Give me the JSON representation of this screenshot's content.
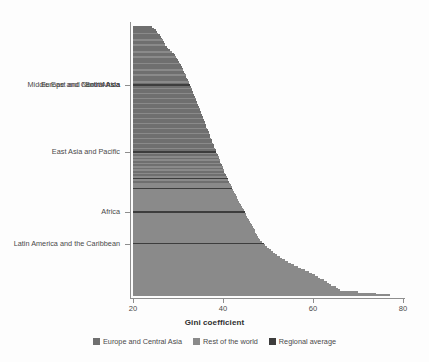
{
  "chart_data": {
    "type": "bar",
    "orientation": "horizontal",
    "title": "",
    "xlabel": "Gini coefficient",
    "ylabel": "",
    "xlim": [
      20,
      80
    ],
    "ylim": [
      0,
      160
    ],
    "grid": false,
    "xticks": [
      20,
      40,
      60,
      80
    ],
    "xtick_labels": [
      "20",
      "40",
      "60",
      "80"
    ],
    "legend_position": "bottom",
    "legend": [
      {
        "label": "Europe and Central Asia",
        "color": "#6f6f6f"
      },
      {
        "label": "Rest of the world",
        "color": "#8a8a8a"
      },
      {
        "label": "Regional average",
        "color": "#3d3d3d"
      }
    ],
    "ytick_labels": [
      {
        "label": "Europe and Central Asia",
        "value": 32.7
      },
      {
        "label": "South Asia",
        "value": 34.7
      },
      {
        "label": "Middle East and North Africa",
        "value": 35.0
      },
      {
        "label": "East Asia and Pacific",
        "value": 36.6
      },
      {
        "label": "Africa",
        "value": 44.8
      },
      {
        "label": "Latin America and the Caribbean",
        "value": 49.0
      }
    ],
    "series": [
      {
        "name": "Europe and Central Asia",
        "color": "#6f6f6f"
      },
      {
        "name": "Rest of the world",
        "color": "#8a8a8a"
      },
      {
        "name": "Regional average",
        "color": "#3d3d3d"
      }
    ],
    "values": [
      {
        "v": 24.2,
        "g": "eca"
      },
      {
        "v": 24.6,
        "g": "eca"
      },
      {
        "v": 25.0,
        "g": "eca"
      },
      {
        "v": 25.3,
        "g": "eca"
      },
      {
        "v": 25.6,
        "g": "rest"
      },
      {
        "v": 25.9,
        "g": "eca"
      },
      {
        "v": 26.2,
        "g": "eca"
      },
      {
        "v": 26.4,
        "g": "eca"
      },
      {
        "v": 26.6,
        "g": "rest"
      },
      {
        "v": 26.8,
        "g": "eca"
      },
      {
        "v": 27.0,
        "g": "eca"
      },
      {
        "v": 27.2,
        "g": "rest"
      },
      {
        "v": 27.5,
        "g": "eca"
      },
      {
        "v": 27.8,
        "g": "eca"
      },
      {
        "v": 28.2,
        "g": "eca"
      },
      {
        "v": 28.6,
        "g": "rest"
      },
      {
        "v": 29.0,
        "g": "eca"
      },
      {
        "v": 29.3,
        "g": "eca"
      },
      {
        "v": 29.5,
        "g": "rest"
      },
      {
        "v": 29.8,
        "g": "eca"
      },
      {
        "v": 30.0,
        "g": "eca"
      },
      {
        "v": 30.2,
        "g": "eca"
      },
      {
        "v": 30.4,
        "g": "rest"
      },
      {
        "v": 30.6,
        "g": "eca"
      },
      {
        "v": 30.8,
        "g": "eca"
      },
      {
        "v": 31.0,
        "g": "eca"
      },
      {
        "v": 31.2,
        "g": "rest"
      },
      {
        "v": 31.4,
        "g": "eca"
      },
      {
        "v": 31.5,
        "g": "eca"
      },
      {
        "v": 31.7,
        "g": "rest"
      },
      {
        "v": 31.8,
        "g": "eca"
      },
      {
        "v": 32.0,
        "g": "eca"
      },
      {
        "v": 32.2,
        "g": "eca"
      },
      {
        "v": 32.4,
        "g": "rest"
      },
      {
        "v": 32.5,
        "g": "eca"
      },
      {
        "v": 32.7,
        "g": "avg"
      },
      {
        "v": 32.8,
        "g": "eca"
      },
      {
        "v": 33.0,
        "g": "rest"
      },
      {
        "v": 33.1,
        "g": "eca"
      },
      {
        "v": 33.3,
        "g": "eca"
      },
      {
        "v": 33.4,
        "g": "rest"
      },
      {
        "v": 33.6,
        "g": "eca"
      },
      {
        "v": 33.7,
        "g": "eca"
      },
      {
        "v": 33.9,
        "g": "rest"
      },
      {
        "v": 34.0,
        "g": "eca"
      },
      {
        "v": 34.2,
        "g": "eca"
      },
      {
        "v": 34.3,
        "g": "rest"
      },
      {
        "v": 34.5,
        "g": "eca"
      },
      {
        "v": 34.6,
        "g": "eca"
      },
      {
        "v": 34.8,
        "g": "rest"
      },
      {
        "v": 34.9,
        "g": "eca"
      },
      {
        "v": 35.0,
        "g": "eca"
      },
      {
        "v": 35.2,
        "g": "rest"
      },
      {
        "v": 35.3,
        "g": "eca"
      },
      {
        "v": 35.5,
        "g": "eca"
      },
      {
        "v": 35.6,
        "g": "rest"
      },
      {
        "v": 35.8,
        "g": "eca"
      },
      {
        "v": 35.9,
        "g": "eca"
      },
      {
        "v": 36.0,
        "g": "rest"
      },
      {
        "v": 36.2,
        "g": "eca"
      },
      {
        "v": 36.3,
        "g": "eca"
      },
      {
        "v": 36.5,
        "g": "rest"
      },
      {
        "v": 36.6,
        "g": "eca"
      },
      {
        "v": 36.8,
        "g": "eca"
      },
      {
        "v": 36.9,
        "g": "rest"
      },
      {
        "v": 37.0,
        "g": "eca"
      },
      {
        "v": 37.2,
        "g": "eca"
      },
      {
        "v": 37.3,
        "g": "rest"
      },
      {
        "v": 37.5,
        "g": "eca"
      },
      {
        "v": 37.6,
        "g": "eca"
      },
      {
        "v": 37.8,
        "g": "rest"
      },
      {
        "v": 37.9,
        "g": "eca"
      },
      {
        "v": 38.1,
        "g": "eca"
      },
      {
        "v": 38.2,
        "g": "rest"
      },
      {
        "v": 38.4,
        "g": "eca"
      },
      {
        "v": 38.5,
        "g": "avg"
      },
      {
        "v": 38.7,
        "g": "rest"
      },
      {
        "v": 38.8,
        "g": "eca"
      },
      {
        "v": 39.0,
        "g": "rest"
      },
      {
        "v": 39.1,
        "g": "eca"
      },
      {
        "v": 39.3,
        "g": "rest"
      },
      {
        "v": 39.4,
        "g": "eca"
      },
      {
        "v": 39.6,
        "g": "rest"
      },
      {
        "v": 39.7,
        "g": "eca"
      },
      {
        "v": 39.9,
        "g": "rest"
      },
      {
        "v": 40.0,
        "g": "eca"
      },
      {
        "v": 40.2,
        "g": "rest"
      },
      {
        "v": 40.3,
        "g": "eca"
      },
      {
        "v": 40.5,
        "g": "rest"
      },
      {
        "v": 40.6,
        "g": "eca"
      },
      {
        "v": 40.8,
        "g": "rest"
      },
      {
        "v": 41.0,
        "g": "avg"
      },
      {
        "v": 41.2,
        "g": "rest"
      },
      {
        "v": 41.3,
        "g": "eca"
      },
      {
        "v": 41.5,
        "g": "rest"
      },
      {
        "v": 41.7,
        "g": "rest"
      },
      {
        "v": 41.9,
        "g": "rest"
      },
      {
        "v": 42.0,
        "g": "avg"
      },
      {
        "v": 42.2,
        "g": "rest"
      },
      {
        "v": 42.4,
        "g": "rest"
      },
      {
        "v": 42.6,
        "g": "rest"
      },
      {
        "v": 42.8,
        "g": "rest"
      },
      {
        "v": 43.0,
        "g": "rest"
      },
      {
        "v": 43.2,
        "g": "rest"
      },
      {
        "v": 43.4,
        "g": "rest"
      },
      {
        "v": 43.6,
        "g": "rest"
      },
      {
        "v": 43.8,
        "g": "rest"
      },
      {
        "v": 44.0,
        "g": "rest"
      },
      {
        "v": 44.2,
        "g": "rest"
      },
      {
        "v": 44.4,
        "g": "rest"
      },
      {
        "v": 44.6,
        "g": "rest"
      },
      {
        "v": 44.8,
        "g": "avg"
      },
      {
        "v": 45.0,
        "g": "rest"
      },
      {
        "v": 45.2,
        "g": "rest"
      },
      {
        "v": 45.4,
        "g": "rest"
      },
      {
        "v": 45.6,
        "g": "rest"
      },
      {
        "v": 45.8,
        "g": "rest"
      },
      {
        "v": 46.0,
        "g": "rest"
      },
      {
        "v": 46.2,
        "g": "rest"
      },
      {
        "v": 46.4,
        "g": "rest"
      },
      {
        "v": 46.6,
        "g": "rest"
      },
      {
        "v": 46.8,
        "g": "rest"
      },
      {
        "v": 47.0,
        "g": "rest"
      },
      {
        "v": 47.2,
        "g": "rest"
      },
      {
        "v": 47.4,
        "g": "rest"
      },
      {
        "v": 47.6,
        "g": "rest"
      },
      {
        "v": 47.8,
        "g": "rest"
      },
      {
        "v": 48.0,
        "g": "rest"
      },
      {
        "v": 48.3,
        "g": "rest"
      },
      {
        "v": 48.6,
        "g": "rest"
      },
      {
        "v": 49.0,
        "g": "avg"
      },
      {
        "v": 49.4,
        "g": "rest"
      },
      {
        "v": 49.8,
        "g": "rest"
      },
      {
        "v": 50.2,
        "g": "rest"
      },
      {
        "v": 50.6,
        "g": "rest"
      },
      {
        "v": 51.0,
        "g": "rest"
      },
      {
        "v": 51.5,
        "g": "rest"
      },
      {
        "v": 52.0,
        "g": "rest"
      },
      {
        "v": 52.6,
        "g": "rest"
      },
      {
        "v": 53.2,
        "g": "rest"
      },
      {
        "v": 53.8,
        "g": "rest"
      },
      {
        "v": 54.4,
        "g": "rest"
      },
      {
        "v": 55.0,
        "g": "rest"
      },
      {
        "v": 55.8,
        "g": "rest"
      },
      {
        "v": 56.6,
        "g": "rest"
      },
      {
        "v": 57.4,
        "g": "rest"
      },
      {
        "v": 58.2,
        "g": "rest"
      },
      {
        "v": 59.0,
        "g": "rest"
      },
      {
        "v": 59.8,
        "g": "rest"
      },
      {
        "v": 60.5,
        "g": "rest"
      },
      {
        "v": 61.0,
        "g": "rest"
      },
      {
        "v": 61.5,
        "g": "rest"
      },
      {
        "v": 62.5,
        "g": "rest"
      },
      {
        "v": 63.2,
        "g": "rest"
      },
      {
        "v": 63.6,
        "g": "rest"
      },
      {
        "v": 64.0,
        "g": "rest"
      },
      {
        "v": 65.2,
        "g": "rest"
      },
      {
        "v": 65.6,
        "g": "rest"
      },
      {
        "v": 66.0,
        "g": "rest"
      },
      {
        "v": 70.0,
        "g": "rest"
      },
      {
        "v": 74.0,
        "g": "rest"
      },
      {
        "v": 77.0,
        "g": "rest"
      }
    ]
  }
}
